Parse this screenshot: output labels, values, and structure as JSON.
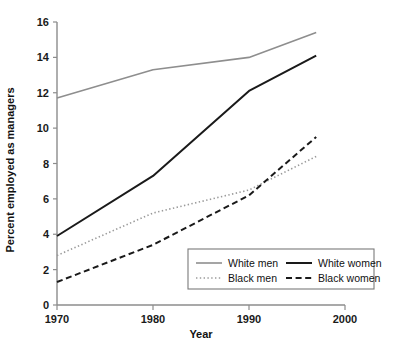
{
  "chart_data": {
    "type": "line",
    "title": "",
    "xlabel": "Year",
    "ylabel": "Percent employed as managers",
    "xlim": [
      1970,
      2000
    ],
    "ylim": [
      0,
      16
    ],
    "xticks": [
      1970,
      1980,
      1990,
      2000
    ],
    "yticks": [
      0,
      2,
      4,
      6,
      8,
      10,
      12,
      14,
      16
    ],
    "xtick_labels": [
      "1970",
      "1980",
      "1990",
      "2000"
    ],
    "ytick_labels": [
      "0",
      "2",
      "4",
      "6",
      "8",
      "10",
      "12",
      "14",
      "16"
    ],
    "grid": false,
    "legend_position": "bottom-right",
    "x": [
      1970,
      1980,
      1990,
      1997
    ],
    "series": [
      {
        "name": "White men",
        "values": [
          11.7,
          13.3,
          14.0,
          15.4
        ],
        "color": "#8e8e8e",
        "style": "solid",
        "width": 1.6
      },
      {
        "name": "White women",
        "values": [
          3.9,
          7.3,
          12.1,
          14.1
        ],
        "color": "#1a1a1a",
        "style": "solid",
        "width": 2.0
      },
      {
        "name": "Black men",
        "values": [
          2.8,
          5.2,
          6.5,
          8.4
        ],
        "color": "#9a9a9a",
        "style": "dotted",
        "width": 1.6
      },
      {
        "name": "Black women",
        "values": [
          1.3,
          3.4,
          6.2,
          9.5
        ],
        "color": "#1a1a1a",
        "style": "dashed",
        "width": 2.0
      }
    ]
  },
  "legend": {
    "entries": [
      {
        "label": "White men"
      },
      {
        "label": "White women"
      },
      {
        "label": "Black men"
      },
      {
        "label": "Black women"
      }
    ]
  },
  "axes": {
    "x_title": "Year",
    "y_title": "Percent employed as managers"
  }
}
